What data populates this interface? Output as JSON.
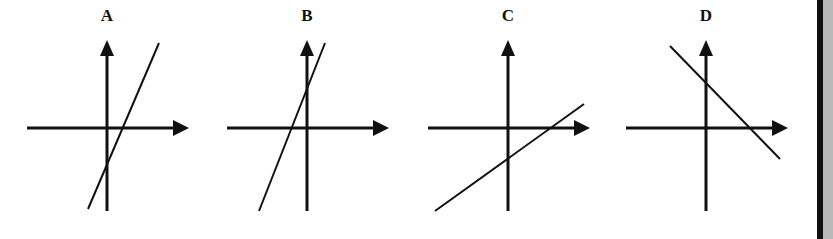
{
  "panels": [
    {
      "label": "A",
      "axis_x": 107,
      "line": {
        "x1": 88,
        "y1": 209,
        "x2": 159,
        "y2": 43
      },
      "description": "positive steep slope, negative y-intercept, positive x-intercept"
    },
    {
      "label": "B",
      "axis_x": 307,
      "line": {
        "x1": 259,
        "y1": 211,
        "x2": 325,
        "y2": 43
      },
      "description": "positive steep slope, positive y-intercept, negative x-intercept"
    },
    {
      "label": "C",
      "axis_x": 508,
      "line": {
        "x1": 435,
        "y1": 211,
        "x2": 584,
        "y2": 104
      },
      "description": "positive shallow slope, negative y-intercept, positive x-intercept"
    },
    {
      "label": "D",
      "axis_x": 706,
      "line": {
        "x1": 670,
        "y1": 46,
        "x2": 780,
        "y2": 159
      },
      "description": "negative slope, positive y-intercept, positive x-intercept"
    }
  ],
  "colors": {
    "ink": "#111111",
    "background": "#ffffff",
    "side_border": "#111111",
    "side_band": "#b9b9b9"
  }
}
